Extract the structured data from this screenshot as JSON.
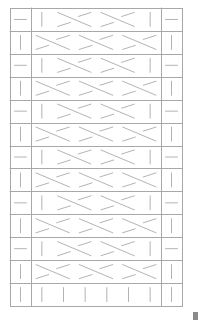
{
  "chart": {
    "type": "knitting-cable-chart",
    "rows": 13,
    "frame": {
      "left": 10,
      "top": 8,
      "right": 182,
      "bottom": 306
    },
    "columns": {
      "left_edge_width": 21,
      "right_edge_start": 161
    },
    "center_slots": 6,
    "colors": {
      "grid": "#a8a8a8",
      "symbol": "#b4b4b4",
      "background": "#ffffff",
      "scroll_thumb": "#8a8a8a"
    },
    "row_patterns": [
      {
        "edge": "dash",
        "center": [
          "bar",
          "cross",
          "cross",
          "bar"
        ]
      },
      {
        "edge": "bar",
        "center": [
          "cross",
          "cross",
          "cross"
        ]
      },
      {
        "edge": "dash",
        "center": [
          "bar",
          "cross",
          "cross",
          "bar"
        ]
      },
      {
        "edge": "bar",
        "center": [
          "cross",
          "cross",
          "cross"
        ]
      },
      {
        "edge": "dash",
        "center": [
          "bar",
          "cross",
          "cross",
          "bar"
        ]
      },
      {
        "edge": "bar",
        "center": [
          "cross",
          "cross",
          "cross"
        ]
      },
      {
        "edge": "dash",
        "center": [
          "bar",
          "cross",
          "cross",
          "bar"
        ]
      },
      {
        "edge": "bar",
        "center": [
          "cross",
          "cross",
          "cross"
        ]
      },
      {
        "edge": "dash",
        "center": [
          "bar",
          "cross",
          "cross",
          "bar"
        ]
      },
      {
        "edge": "bar",
        "center": [
          "cross",
          "cross",
          "cross"
        ]
      },
      {
        "edge": "dash",
        "center": [
          "bar",
          "cross",
          "cross",
          "bar"
        ]
      },
      {
        "edge": "bar",
        "center": [
          "cross",
          "cross",
          "cross"
        ]
      },
      {
        "edge": "bar",
        "center": [
          "bar",
          "bar",
          "bar",
          "bar",
          "bar",
          "bar"
        ]
      }
    ],
    "symbol_legend": {
      "dash": "horizontal-dash-icon",
      "bar": "vertical-bar-icon",
      "cross": "cable-cross-icon"
    }
  }
}
